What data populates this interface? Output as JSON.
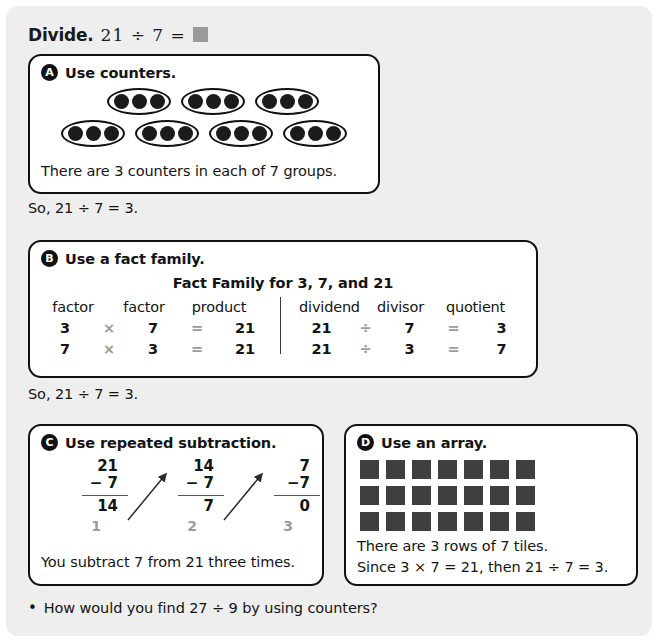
{
  "header": {
    "lead": "Divide.",
    "expression": "21 ÷ 7 =",
    "answer_blank": ""
  },
  "panels": [
    {
      "badge": "A",
      "title": "Use counters.",
      "footer": "There are 3 counters in each of 7 groups.",
      "counters": {
        "groups": 7,
        "dots_per_group": 3,
        "row1_groups": 3,
        "row2_groups": 4
      }
    },
    {
      "badge": "B",
      "title": "Use a fact family.",
      "fact_family_title": "Fact Family for 3, 7, and 21",
      "multiplication": {
        "headers": [
          "factor",
          "factor",
          "product"
        ],
        "rows": [
          {
            "a": "3",
            "op1": "×",
            "b": "7",
            "op2": "=",
            "result": "21"
          },
          {
            "a": "7",
            "op1": "×",
            "b": "3",
            "op2": "=",
            "result": "21"
          }
        ]
      },
      "division": {
        "headers": [
          "dividend",
          "divisor",
          "quotient"
        ],
        "rows": [
          {
            "a": "21",
            "op1": "÷",
            "b": "7",
            "op2": "=",
            "result": "3"
          },
          {
            "a": "21",
            "op1": "÷",
            "b": "3",
            "op2": "=",
            "result": "7"
          }
        ]
      }
    },
    {
      "badge": "C",
      "title": "Use repeated subtraction.",
      "footer": "You subtract 7 from 21 three times.",
      "steps": [
        {
          "minuend": "21",
          "subtrahend": "− 7",
          "result": "14",
          "step": "1"
        },
        {
          "minuend": "14",
          "subtrahend": "− 7",
          "result": "7",
          "step": "2"
        },
        {
          "minuend": "7",
          "subtrahend": "−7",
          "result": "0",
          "step": "3"
        }
      ]
    },
    {
      "badge": "D",
      "title": "Use an array.",
      "array": {
        "rows": 3,
        "cols": 7
      },
      "footer_line1": "There are 3 rows of 7 tiles.",
      "footer_line2": "Since 3 × 7 = 21, then 21 ÷ 7 = 3."
    }
  ],
  "conclusions": {
    "after_a": "So, 21 ÷ 7 = 3.",
    "after_b": "So, 21 ÷ 7 = 3."
  },
  "bottom_question": {
    "bullet": "•",
    "text": "How would you find 27 ÷ 9 by using counters?"
  },
  "colors": {
    "page_background": "#eeeeee",
    "panel_background": "#ffffff",
    "panel_border": "#111111",
    "text": "#141414",
    "muted_operator": "#9b9b9b",
    "tile": "#3f3f3f",
    "blank_placeholder": "#9a9a9a"
  }
}
